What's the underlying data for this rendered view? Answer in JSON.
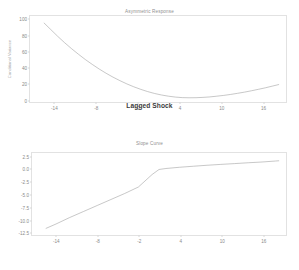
{
  "figure": {
    "background_color": "#ffffff",
    "line_color": "#9a9a9a",
    "frame_color": "#e2e2e2",
    "tick_label_color": "#8a8a8a"
  },
  "chart_data": [
    {
      "type": "line",
      "title": "Asymmetric Response",
      "xlabel": "Lagged Shock",
      "ylabel": "Conditional Variance",
      "xlim": [
        -17.5,
        19.5
      ],
      "ylim": [
        -4,
        104
      ],
      "grid": false,
      "legend": null,
      "xticks": [
        -14,
        -8,
        -2,
        4,
        10,
        16
      ],
      "xticklabels": [
        "-14",
        "-8",
        "-2",
        "4",
        "10",
        "16"
      ],
      "yticks": [
        0,
        20,
        40,
        60,
        80,
        100
      ],
      "yticklabels": [
        "0",
        "20",
        "40",
        "60",
        "80",
        "100"
      ],
      "series": [
        {
          "name": "Conditional Variance",
          "x": [
            -15.5,
            -14.5,
            -13.5,
            -12.5,
            -11.5,
            -10.5,
            -9.5,
            -8.5,
            -7.5,
            -6.5,
            -5.5,
            -4.5,
            -3.5,
            -2.5,
            -1.5,
            -0.5,
            0.5,
            1.5,
            2.5,
            3.5,
            4.5,
            5.5,
            6.5,
            7.5,
            8.5,
            9.5,
            10.5,
            11.5,
            12.5,
            13.5,
            14.5,
            15.5,
            16.5,
            17.5,
            18.5
          ],
          "y": [
            95.5,
            87.0,
            78.5,
            70.5,
            63.0,
            56.0,
            49.3,
            43.2,
            37.4,
            32.1,
            27.2,
            22.8,
            18.7,
            15.1,
            11.9,
            9.1,
            6.7,
            4.8,
            3.3,
            2.2,
            1.5,
            1.3,
            1.4,
            1.8,
            2.4,
            3.3,
            4.3,
            5.5,
            6.9,
            8.4,
            10.1,
            11.9,
            13.8,
            15.9,
            18.0
          ]
        }
      ]
    },
    {
      "type": "line",
      "title": "Slope Curve",
      "xlabel": "",
      "ylabel": "",
      "xlim": [
        -17.5,
        19.5
      ],
      "ylim": [
        -13.2,
        3.2
      ],
      "grid": false,
      "legend": null,
      "xticks": [
        -14,
        -8,
        -2,
        4,
        10,
        16
      ],
      "xticklabels": [
        "-14",
        "-8",
        "-2",
        "4",
        "10",
        "16"
      ],
      "yticks": [
        2.5,
        0.0,
        -2.5,
        -5.0,
        -7.5,
        -10.0,
        -12.5
      ],
      "yticklabels": [
        "2.5",
        "0.0",
        "-2.5",
        "-5.0",
        "-7.5",
        "-10.0",
        "-12.5"
      ],
      "series": [
        {
          "name": "Slope",
          "x": [
            -15.5,
            -14.0,
            -12.0,
            -10.0,
            -8.0,
            -6.0,
            -4.0,
            -2.0,
            0.0,
            1.0,
            2.0,
            4.0,
            6.0,
            8.0,
            10.0,
            12.0,
            14.0,
            16.0,
            18.0,
            18.5
          ],
          "y": [
            -11.9,
            -11.0,
            -9.7,
            -8.5,
            -7.3,
            -6.1,
            -4.9,
            -3.6,
            -1.1,
            -0.1,
            0.1,
            0.35,
            0.55,
            0.75,
            0.92,
            1.08,
            1.25,
            1.4,
            1.6,
            1.65
          ]
        }
      ]
    }
  ]
}
